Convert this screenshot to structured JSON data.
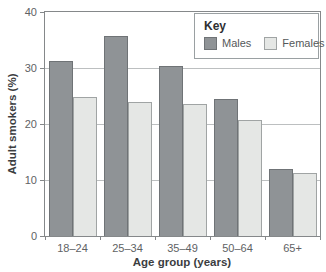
{
  "chart_data": {
    "type": "bar",
    "title": "",
    "xlabel": "Age group (years)",
    "ylabel": "Adult smokers (%)",
    "categories": [
      "18–24",
      "25–34",
      "35–49",
      "50–64",
      "65+"
    ],
    "series": [
      {
        "name": "Males",
        "values": [
          31.3,
          35.7,
          30.4,
          24.4,
          12.0
        ],
        "color": "#8f9396",
        "border": "#6f7376"
      },
      {
        "name": "Females",
        "values": [
          24.9,
          24.0,
          23.5,
          20.8,
          11.2
        ],
        "color": "#e5e7e5",
        "border": "#a0a4a4"
      }
    ],
    "ylim": [
      0,
      40
    ],
    "yticks": [
      0,
      10,
      20,
      30,
      40
    ],
    "grid": true,
    "legend": {
      "title": "Key",
      "position": "top-right"
    }
  },
  "colors": {
    "background": "#ffffff",
    "plot_border": "#85888a",
    "gridline": "#bcbfc0",
    "tick_label": "#606264",
    "axis_title": "#3b3d3f",
    "legend_border": "#9aa0a2"
  }
}
